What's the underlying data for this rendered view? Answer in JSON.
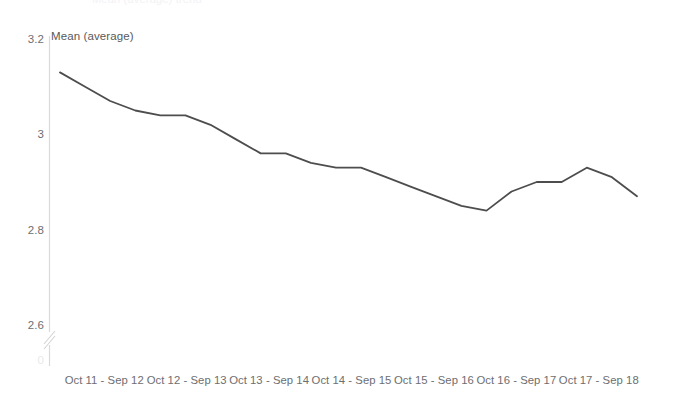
{
  "header": {
    "clipped_title": "Mean (average) trend"
  },
  "chart_data": {
    "type": "line",
    "title": "",
    "ylabel": "Mean (average)",
    "xlabel": "",
    "yticks": [
      "3.2",
      "3",
      "2.8",
      "2.6"
    ],
    "ytick_values": [
      3.2,
      3.0,
      2.8,
      2.6
    ],
    "ylim": [
      2.6,
      3.2
    ],
    "axis_break": true,
    "axis_break_label": "0",
    "grid": false,
    "legend": false,
    "line_color": "#4d4d4d",
    "axis_color": "#d9d9dc",
    "categories": [
      "Oct 11 - Sep 12",
      "Oct 12 - Sep 13",
      "Oct 13 - Sep 14",
      "Oct 14 - Sep 15",
      "Oct 15 - Sep 16",
      "Oct 16 - Sep 17",
      "Oct 17 - Sep 18"
    ],
    "series": [
      {
        "name": "Mean (average)",
        "x": [
          0,
          1,
          2,
          3,
          4,
          5,
          6,
          7,
          8,
          9,
          10,
          11,
          12,
          13,
          14,
          15,
          16,
          17,
          18,
          19,
          20,
          21,
          22,
          23
        ],
        "values": [
          3.13,
          3.1,
          3.07,
          3.05,
          3.04,
          3.04,
          3.02,
          2.99,
          2.96,
          2.96,
          2.94,
          2.93,
          2.93,
          2.91,
          2.89,
          2.87,
          2.85,
          2.84,
          2.88,
          2.9,
          2.9,
          2.93,
          2.91,
          2.87
        ]
      }
    ]
  }
}
